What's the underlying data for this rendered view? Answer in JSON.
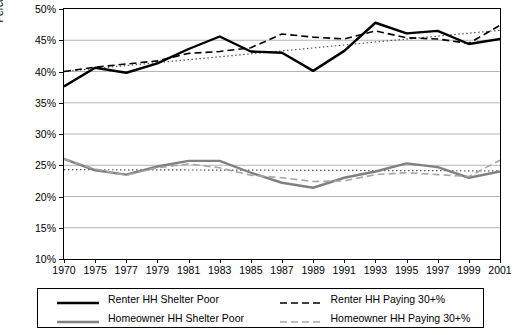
{
  "chart_data": {
    "type": "line",
    "title": "",
    "xlabel": "",
    "ylabel": "Percent of Households",
    "ylim": [
      10,
      50
    ],
    "yticks": [
      "10%",
      "15%",
      "20%",
      "25%",
      "30%",
      "35%",
      "40%",
      "45%",
      "50%"
    ],
    "xticks": [
      "1970",
      "1975",
      "1977",
      "1979",
      "1981",
      "1983",
      "1985",
      "1987",
      "1989",
      "1991",
      "1993",
      "1995",
      "1997",
      "1999",
      "2001"
    ],
    "x": [
      1970,
      1975,
      1977,
      1979,
      1981,
      1983,
      1985,
      1987,
      1989,
      1991,
      1993,
      1995,
      1997,
      1999,
      2001
    ],
    "grid": true,
    "legend_position": "bottom",
    "series": [
      {
        "name": "Renter HH Shelter Poor",
        "color": "#000000",
        "style": "solid",
        "width": 2.4,
        "values": [
          37.6,
          40.6,
          39.8,
          41.3,
          43.6,
          45.6,
          43.2,
          43.0,
          40.1,
          43.3,
          47.8,
          46.1,
          46.5,
          44.4,
          45.2
        ],
        "values_detail": [
          {
            "x": 1970,
            "y": 37.6
          },
          {
            "x": 1975,
            "y": 40.6
          },
          {
            "x": 1977,
            "y": 39.8
          },
          {
            "x": 1979,
            "y": 41.3
          },
          {
            "x": 1981,
            "y": 43.6
          },
          {
            "x": 1983,
            "y": 45.6
          },
          {
            "x": 1985,
            "y": 43.2
          },
          {
            "x": 1987,
            "y": 43.0
          },
          {
            "x": 1989,
            "y": 40.1
          },
          {
            "x": 1991,
            "y": 43.3
          },
          {
            "x": 1993,
            "y": 47.8
          },
          {
            "x": 1995,
            "y": 46.1
          },
          {
            "x": 1997,
            "y": 46.5
          },
          {
            "x": 1999,
            "y": 44.4
          },
          {
            "x": 2001,
            "y": 45.2
          }
        ]
      },
      {
        "name": "Renter HH Paying 30+%",
        "color": "#000000",
        "style": "dashed",
        "width": 1.6,
        "values": [
          40.0,
          40.7,
          41.2,
          41.7,
          42.9,
          43.2,
          43.8,
          46.0,
          45.5,
          45.2,
          46.5,
          45.4,
          45.2,
          44.5,
          47.4
        ],
        "values_detail": [
          {
            "x": 1970,
            "y": 40.0
          },
          {
            "x": 1975,
            "y": 40.7
          },
          {
            "x": 1977,
            "y": 41.2
          },
          {
            "x": 1979,
            "y": 41.7
          },
          {
            "x": 1981,
            "y": 42.9
          },
          {
            "x": 1983,
            "y": 43.2
          },
          {
            "x": 1985,
            "y": 43.8
          },
          {
            "x": 1987,
            "y": 46.0
          },
          {
            "x": 1989,
            "y": 45.5
          },
          {
            "x": 1991,
            "y": 45.2
          },
          {
            "x": 1993,
            "y": 46.5
          },
          {
            "x": 1995,
            "y": 45.4
          },
          {
            "x": 1997,
            "y": 45.2
          },
          {
            "x": 1999,
            "y": 44.5
          },
          {
            "x": 2001,
            "y": 47.4
          }
        ]
      },
      {
        "name": "Homeowner HH Shelter Poor",
        "color": "#808080",
        "style": "solid",
        "width": 2.4,
        "values": [
          26.0,
          24.2,
          23.5,
          24.8,
          25.7,
          25.7,
          23.8,
          22.2,
          21.4,
          23.0,
          24.0,
          25.3,
          24.7,
          23.0,
          24.0
        ],
        "values_detail": [
          {
            "x": 1970,
            "y": 26.0
          },
          {
            "x": 1975,
            "y": 24.2
          },
          {
            "x": 1977,
            "y": 23.5
          },
          {
            "x": 1979,
            "y": 24.8
          },
          {
            "x": 1981,
            "y": 25.7
          },
          {
            "x": 1983,
            "y": 25.7
          },
          {
            "x": 1985,
            "y": 23.8
          },
          {
            "x": 1987,
            "y": 22.2
          },
          {
            "x": 1989,
            "y": 21.4
          },
          {
            "x": 1991,
            "y": 23.0
          },
          {
            "x": 1993,
            "y": 24.0
          },
          {
            "x": 1995,
            "y": 25.3
          },
          {
            "x": 1997,
            "y": 24.7
          },
          {
            "x": 1999,
            "y": 23.0
          },
          {
            "x": 2001,
            "y": 24.0
          }
        ]
      },
      {
        "name": "Homeowner HH Paying 30+%",
        "color": "#a6a6a6",
        "style": "dashed",
        "width": 1.6,
        "values": [
          26.0,
          24.4,
          23.4,
          24.6,
          25.2,
          24.6,
          23.4,
          23.0,
          22.4,
          22.5,
          23.5,
          23.8,
          23.5,
          23.2,
          25.8
        ],
        "values_detail": [
          {
            "x": 1970,
            "y": 26.0
          },
          {
            "x": 1975,
            "y": 24.4
          },
          {
            "x": 1977,
            "y": 23.4
          },
          {
            "x": 1979,
            "y": 24.6
          },
          {
            "x": 1981,
            "y": 25.2
          },
          {
            "x": 1983,
            "y": 24.6
          },
          {
            "x": 1985,
            "y": 23.4
          },
          {
            "x": 1987,
            "y": 23.0
          },
          {
            "x": 1989,
            "y": 22.4
          },
          {
            "x": 1991,
            "y": 22.5
          },
          {
            "x": 1993,
            "y": 23.5
          },
          {
            "x": 1995,
            "y": 23.8
          },
          {
            "x": 1997,
            "y": 23.5
          },
          {
            "x": 1999,
            "y": 23.2
          },
          {
            "x": 2001,
            "y": 25.8
          }
        ]
      }
    ],
    "trendlines": [
      {
        "name": "renter-trend",
        "color": "#555555",
        "style": "dotted",
        "from": {
          "x": 1970,
          "y": 40.0
        },
        "to": {
          "x": 2001,
          "y": 46.6
        }
      },
      {
        "name": "homeowner-trend",
        "color": "#555555",
        "style": "dotted",
        "from": {
          "x": 1970,
          "y": 24.3
        },
        "to": {
          "x": 2001,
          "y": 24.1
        }
      }
    ]
  },
  "legend": {
    "items": [
      {
        "label": "Renter HH Shelter Poor"
      },
      {
        "label": "Renter HH Paying 30+%"
      },
      {
        "label": "Homeowner HH Shelter Poor"
      },
      {
        "label": "Homeowner HH Paying 30+%"
      }
    ]
  },
  "axis": {
    "y_title": "Percent of Households"
  }
}
